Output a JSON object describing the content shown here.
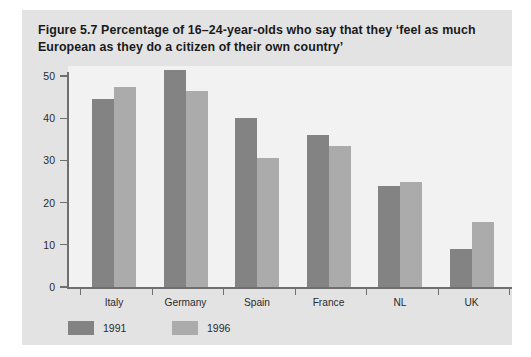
{
  "figure": {
    "title": "Figure 5.7  Percentage of 16–24-year-olds who say that they ‘feel as much European as they do a citizen of their own country’"
  },
  "colors": {
    "panel_background": "#e3e3e3",
    "plot_background": "#f2f2f2",
    "axis": "#6f6f6f",
    "series_1991": "#838383",
    "series_1996": "#ababab",
    "text": "#2b2b2b"
  },
  "chart_data": {
    "type": "bar",
    "title": "Figure 5.7  Percentage of 16–24-year-olds who say that they ‘feel as much European as they do a citizen of their own country’",
    "xlabel": "",
    "ylabel": "",
    "categories": [
      "Italy",
      "Germany",
      "Spain",
      "France",
      "NL",
      "UK"
    ],
    "series": [
      {
        "name": "1991",
        "color": "#838383",
        "values": [
          44.5,
          51.5,
          40,
          36,
          24,
          9
        ]
      },
      {
        "name": "1996",
        "color": "#ababab",
        "values": [
          47.5,
          46.5,
          30.5,
          33.5,
          25,
          15.5
        ]
      }
    ],
    "ylim": [
      0,
      50
    ],
    "yticks": [
      0,
      10,
      20,
      30,
      40,
      50
    ],
    "ytick_labels": [
      "0",
      "10",
      "20",
      "30",
      "40",
      "50"
    ],
    "grid": false,
    "legend_position": "below-axes-left"
  }
}
